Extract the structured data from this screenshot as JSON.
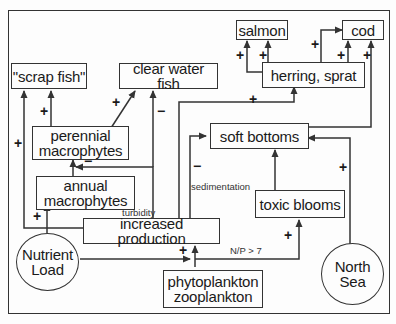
{
  "nodes": {
    "scrap_fish": "\"scrap fish\"",
    "clear_water_fish": "clear water fish",
    "salmon": "salmon",
    "cod": "cod",
    "herring_sprat": "herring, sprat",
    "perennial_line1": "perennial",
    "perennial_line2": "macrophytes",
    "annual_line1": "annual",
    "annual_line2": "macrophytes",
    "soft_bottoms": "soft bottoms",
    "toxic_blooms": "toxic blooms",
    "increased_production": "increased production",
    "nutrient_line1": "Nutrient",
    "nutrient_line2": "Load",
    "plankton_line1": "phytoplankton",
    "plankton_line2": "zooplankton",
    "north_sea_line1": "North",
    "north_sea_line2": "Sea"
  },
  "edge_labels": {
    "turbidity": "turbidity",
    "sedimentation": "sedimentation",
    "np_ratio": "N/P > 7"
  },
  "signs": {
    "plus": "+",
    "minus": "−"
  },
  "colors": {
    "line": "#333333",
    "background": "#fdfdfd"
  }
}
